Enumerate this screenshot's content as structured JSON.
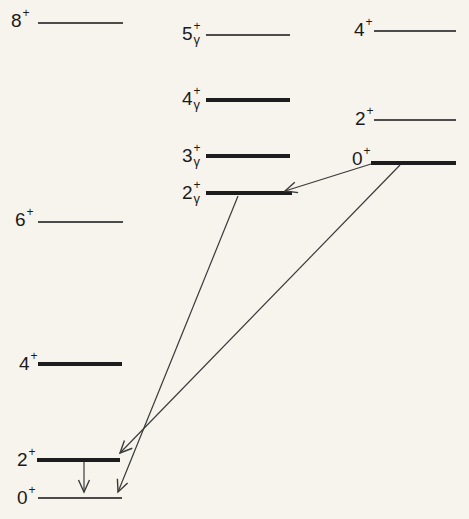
{
  "meta": {
    "figure_type": "nuclear-energy-level-scheme",
    "background_color": "#f7f4ed",
    "thin_level_color": "#4c4c4c",
    "thick_level_color": "#1d1d1d",
    "arrow_color": "#3a3a3a",
    "label_color": "#1a1a1a"
  },
  "bands": {
    "ground": {
      "name": "ground-state band",
      "levels": [
        {
          "spin": "8",
          "parity": "+",
          "sub": "",
          "line": "thin"
        },
        {
          "spin": "6",
          "parity": "+",
          "sub": "",
          "line": "thin"
        },
        {
          "spin": "4",
          "parity": "+",
          "sub": "",
          "line": "thick"
        },
        {
          "spin": "2",
          "parity": "+",
          "sub": "",
          "line": "thick"
        },
        {
          "spin": "0",
          "parity": "+",
          "sub": "",
          "line": "thin"
        }
      ]
    },
    "gamma": {
      "name": "gamma band",
      "levels": [
        {
          "spin": "5",
          "parity": "+",
          "sub": "γ",
          "line": "thin"
        },
        {
          "spin": "4",
          "parity": "+",
          "sub": "γ",
          "line": "thick"
        },
        {
          "spin": "3",
          "parity": "+",
          "sub": "γ",
          "line": "thick"
        },
        {
          "spin": "2",
          "parity": "+",
          "sub": "γ",
          "line": "thick"
        }
      ]
    },
    "beta": {
      "name": "beta band",
      "levels": [
        {
          "spin": "4",
          "parity": "+",
          "sub": "",
          "line": "thin"
        },
        {
          "spin": "2",
          "parity": "+",
          "sub": "",
          "line": "thin"
        },
        {
          "spin": "0",
          "parity": "+",
          "sub": "",
          "line": "thick"
        }
      ]
    }
  },
  "transitions": [
    {
      "from": "0+ (beta band)",
      "to": "2γ+ (gamma band)"
    },
    {
      "from": "2γ+ (gamma band)",
      "to": "0+ (ground band)"
    },
    {
      "from": "0+ (beta band)",
      "to": "2+ (ground band)"
    },
    {
      "from": "2+ (ground band)",
      "to": "0+ (ground band)"
    }
  ]
}
